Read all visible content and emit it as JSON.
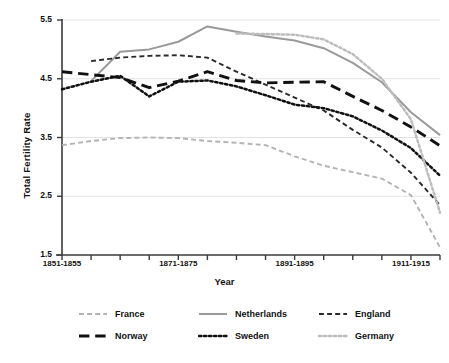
{
  "chart_data": {
    "type": "line",
    "title": "",
    "xlabel": "Year",
    "ylabel": "Total Fertility Rate",
    "ylim": [
      1.5,
      5.5
    ],
    "yticks": [
      "1.5",
      "2.5",
      "3.5",
      "4.5",
      "5.5"
    ],
    "grid": "horizontal",
    "legend_position": "bottom",
    "x": [
      "1851-1855",
      "1856-1860",
      "1861-1865",
      "1866-1870",
      "1871-1875",
      "1876-1880",
      "1881-1885",
      "1886-1890",
      "1891-1895",
      "1896-1900",
      "1901-1905",
      "1906-1910",
      "1911-1915",
      "1916-1920"
    ],
    "xtick_labels": [
      "1851-1855",
      "1871-1875",
      "1891-1895",
      "1911-1915"
    ],
    "xtick_label_index": [
      0,
      4,
      8,
      12
    ],
    "series": [
      {
        "name": "France",
        "color": "#b3b3b3",
        "style": "dashed",
        "values": [
          3.37,
          3.44,
          3.49,
          3.5,
          3.49,
          3.44,
          3.41,
          3.37,
          3.18,
          3.02,
          2.91,
          2.8,
          2.52,
          1.63
        ]
      },
      {
        "name": "Netherlands",
        "color": "#9a9a9a",
        "style": "solid",
        "values": [
          null,
          4.46,
          4.96,
          5.0,
          5.13,
          5.39,
          5.3,
          5.22,
          5.15,
          5.02,
          4.77,
          4.44,
          3.93,
          3.54
        ]
      },
      {
        "name": "England",
        "color": "#2a2a2a",
        "style": "dashed",
        "values": [
          null,
          4.8,
          4.86,
          4.89,
          4.9,
          4.86,
          4.62,
          4.4,
          4.18,
          3.96,
          3.63,
          3.33,
          2.9,
          2.35
        ]
      },
      {
        "name": "Norway",
        "color": "#111111",
        "style": "longdash",
        "values": [
          4.62,
          4.57,
          4.52,
          4.35,
          4.46,
          4.62,
          4.47,
          4.43,
          4.44,
          4.45,
          4.2,
          3.96,
          3.68,
          3.36
        ]
      },
      {
        "name": "Sweden",
        "color": "#111111",
        "style": "dotted",
        "values": [
          4.32,
          4.45,
          4.55,
          4.2,
          4.45,
          4.47,
          4.37,
          4.22,
          4.06,
          4.0,
          3.86,
          3.62,
          3.32,
          2.85
        ]
      },
      {
        "name": "Germany",
        "color": "#bdbdbd",
        "style": "dotted",
        "values": [
          null,
          null,
          null,
          null,
          null,
          null,
          5.27,
          5.26,
          5.25,
          5.17,
          4.92,
          4.5,
          3.81,
          2.22
        ]
      }
    ]
  },
  "axes": {
    "y_title": "Total Fertility Rate",
    "x_title": "Year"
  },
  "legend": {
    "items": [
      {
        "label": "France",
        "color": "#b3b3b3",
        "style": "dashed"
      },
      {
        "label": "Netherlands",
        "color": "#9a9a9a",
        "style": "solid"
      },
      {
        "label": "England",
        "color": "#2a2a2a",
        "style": "dashed"
      },
      {
        "label": "Norway",
        "color": "#111111",
        "style": "longdash"
      },
      {
        "label": "Sweden",
        "color": "#111111",
        "style": "dotted"
      },
      {
        "label": "Germany",
        "color": "#bdbdbd",
        "style": "dotted"
      }
    ]
  },
  "colors": {
    "axis": "#3a3a3a",
    "grid": "#e2e2e2",
    "text": "#111111",
    "background": "#ffffff"
  }
}
